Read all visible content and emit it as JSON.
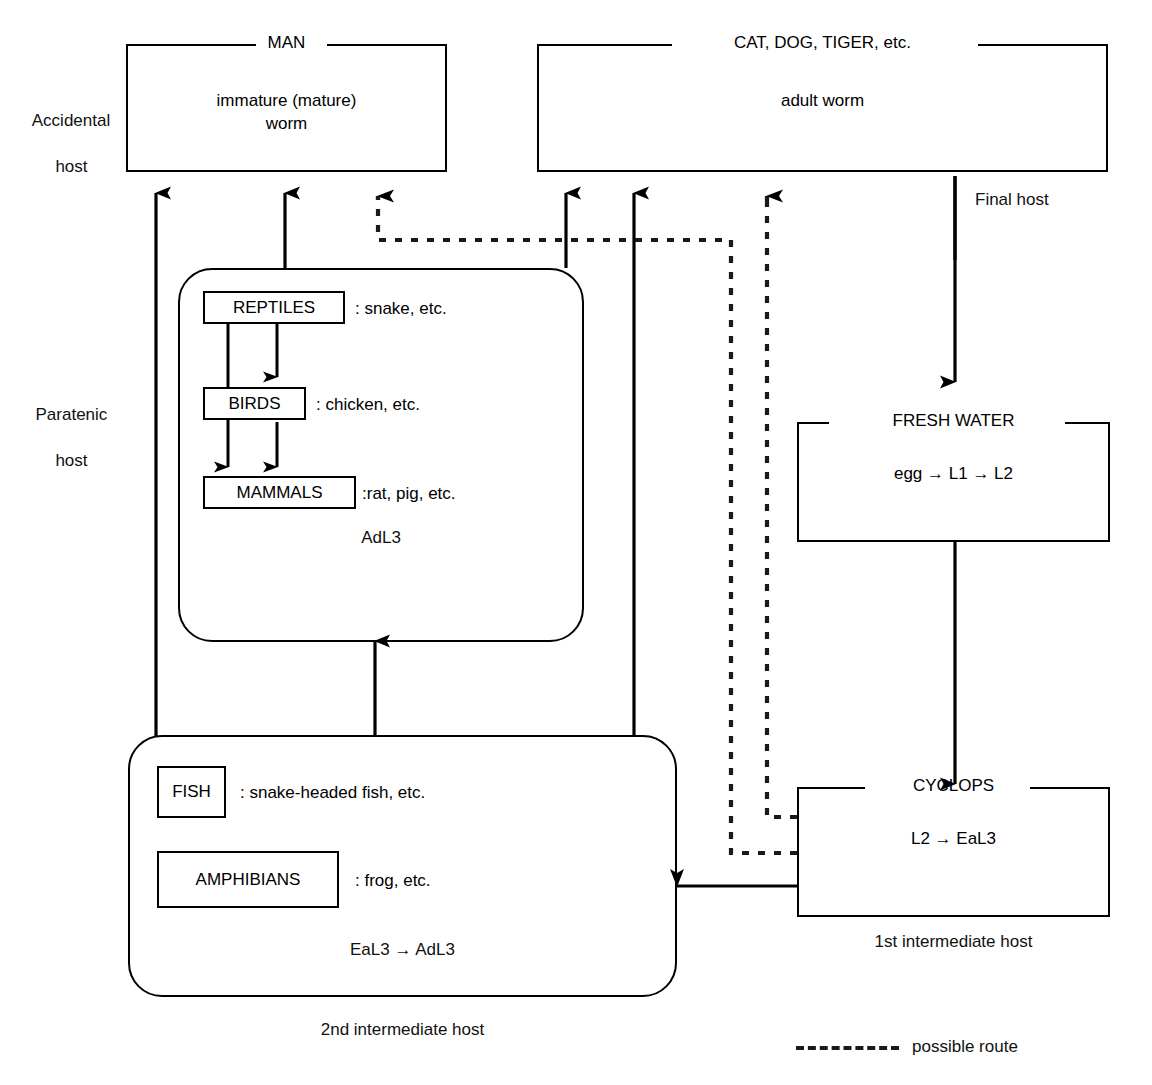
{
  "diagram": {
    "legend": {
      "label": "possible route",
      "style": "dashed"
    },
    "side_labels": [
      {
        "id": "accidental-host",
        "line1": "Accidental",
        "line2": "host"
      },
      {
        "id": "paratenic-host",
        "line1": "Paratenic",
        "line2": "host"
      }
    ],
    "host_boxes": [
      {
        "id": "man",
        "caption": "MAN",
        "body": "immature (mature)\nworm"
      },
      {
        "id": "carnivores",
        "caption": "CAT, DOG, TIGER, etc.",
        "body": "adult worm",
        "role_label": "Final host"
      },
      {
        "id": "fresh-water",
        "caption": "FRESH WATER",
        "body": "egg → L1 → L2"
      },
      {
        "id": "cyclops",
        "caption": "CYCLOPS",
        "body": "L2 → EaL3",
        "role_label": "1st intermediate host"
      }
    ],
    "groups": [
      {
        "id": "paratenic-group",
        "stage_label": "AdL3",
        "members": [
          {
            "id": "reptiles",
            "name": "REPTILES",
            "examples": ": snake, etc."
          },
          {
            "id": "birds",
            "name": "BIRDS",
            "examples": ": chicken, etc."
          },
          {
            "id": "mammals",
            "name": "MAMMALS",
            "examples": ":rat, pig, etc."
          }
        ]
      },
      {
        "id": "second-intermediate-group",
        "stage_label": "EaL3 → AdL3",
        "role_label": "2nd intermediate host",
        "members": [
          {
            "id": "fish",
            "name": "FISH",
            "examples": ": snake-headed fish, etc."
          },
          {
            "id": "amphibians",
            "name": "AMPHIBIANS",
            "examples": ": frog, etc."
          }
        ]
      }
    ],
    "colors": {
      "ink": "#000000",
      "background": "#ffffff",
      "dashed_route": "#1a1a1a"
    }
  }
}
